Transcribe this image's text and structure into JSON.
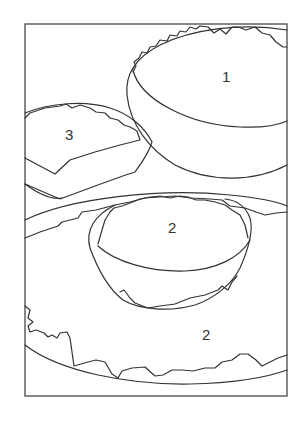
{
  "figure": {
    "line_color": "#333333",
    "background": "#ffffff",
    "regions": [
      {
        "id": "bowl-large",
        "label": "1",
        "x": 227,
        "y": 77
      },
      {
        "id": "block-portion",
        "label": "3",
        "x": 70,
        "y": 134
      },
      {
        "id": "bowl-small",
        "label": "2",
        "x": 173,
        "y": 228
      },
      {
        "id": "plate-spread",
        "label": "2",
        "x": 207,
        "y": 335
      }
    ]
  }
}
